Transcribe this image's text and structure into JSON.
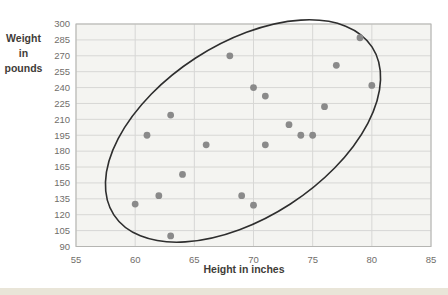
{
  "page": {
    "background": "#ffffff",
    "bottom_strip_color": "#e9e5d8"
  },
  "chart_data": {
    "type": "scatter",
    "title": "",
    "xlabel": "Height in inches",
    "ylabel": "Weight in pounds",
    "ylabel_lines": [
      "Weight in",
      "pounds"
    ],
    "xlim": [
      55,
      85
    ],
    "ylim": [
      90,
      300
    ],
    "x_ticks": [
      55,
      60,
      65,
      70,
      75,
      80,
      85
    ],
    "y_ticks": [
      300,
      285,
      270,
      255,
      240,
      225,
      210,
      195,
      180,
      165,
      150,
      135,
      120,
      105,
      90
    ],
    "grid": true,
    "legend": "none",
    "points": [
      [
        60,
        130
      ],
      [
        61,
        195
      ],
      [
        62,
        138
      ],
      [
        63,
        100
      ],
      [
        63,
        214
      ],
      [
        64,
        158
      ],
      [
        66,
        186
      ],
      [
        68,
        270
      ],
      [
        69,
        138
      ],
      [
        70,
        129
      ],
      [
        70,
        240
      ],
      [
        71,
        186
      ],
      [
        71,
        232
      ],
      [
        73,
        205
      ],
      [
        74,
        195
      ],
      [
        75,
        195
      ],
      [
        76,
        222
      ],
      [
        77,
        261
      ],
      [
        79,
        287
      ],
      [
        80,
        242
      ]
    ],
    "annotation_ellipse": {
      "shape": "rotated-ellipse",
      "center_data": {
        "height": 69.1,
        "weight": 199
      },
      "center_px": [
        243,
        131
      ],
      "rx_px": 154,
      "ry_px": 87,
      "rotation_deg": -33
    },
    "colors": {
      "dot": "#8a8a8a",
      "ellipse_stroke": "#2e2e2e",
      "grid_line": "#d7d7d5",
      "frame": "#b5b5b2",
      "plot_bg": "#f4f4f1",
      "tick_text": "#716e6a",
      "axis_title_text": "#3f3c38"
    }
  }
}
